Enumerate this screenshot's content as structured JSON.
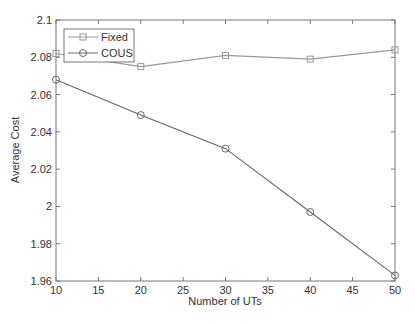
{
  "chart_data": {
    "type": "line",
    "title": "",
    "xlabel": "Number of UTs",
    "ylabel": "Average Cost",
    "x": [
      10,
      20,
      30,
      40,
      50
    ],
    "xlim": [
      10,
      50
    ],
    "ylim": [
      1.96,
      2.1
    ],
    "xticks": [
      10,
      15,
      20,
      25,
      30,
      35,
      40,
      45,
      50
    ],
    "yticks": [
      1.96,
      1.98,
      2,
      2.02,
      2.04,
      2.06,
      2.08,
      2.1
    ],
    "ytick_labels": [
      "1.96",
      "1.98",
      "2",
      "2.02",
      "2.04",
      "2.06",
      "2.08",
      "2.1"
    ],
    "grid": false,
    "legend_position": "upper left",
    "series": [
      {
        "name": "Fixed",
        "marker": "square",
        "color": "#999999",
        "values": [
          2.082,
          2.075,
          2.081,
          2.079,
          2.084
        ]
      },
      {
        "name": "COUS",
        "marker": "circle",
        "color": "#666666",
        "values": [
          2.068,
          2.049,
          2.031,
          1.997,
          1.963
        ]
      }
    ]
  },
  "legend": {
    "items": [
      {
        "label": "Fixed"
      },
      {
        "label": "COUS"
      }
    ]
  }
}
